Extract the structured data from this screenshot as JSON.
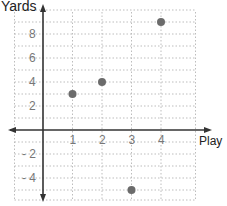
{
  "chart_data": {
    "type": "scatter",
    "title": "",
    "xlabel": "Play",
    "ylabel": "Yards",
    "x": [
      1,
      2,
      3,
      4
    ],
    "y": [
      3,
      4,
      -5,
      9
    ],
    "points": [
      {
        "x": 1,
        "y": 3
      },
      {
        "x": 2,
        "y": 4
      },
      {
        "x": 3,
        "y": -5
      },
      {
        "x": 4,
        "y": 9
      }
    ],
    "x_ticks": [
      "1",
      "2",
      "3",
      "4"
    ],
    "y_ticks": [
      "8",
      "6",
      "4",
      "2",
      "-2",
      "-4"
    ],
    "xlim": [
      -1,
      5
    ],
    "ylim": [
      -6,
      10
    ],
    "grid": true,
    "grid_style": "dotted",
    "legend": null,
    "colors": {
      "point": "#6b6b6b",
      "axis": "#333333",
      "grid": "#bdbdbd",
      "tick_label": "#777777"
    }
  },
  "labels": {
    "y_axis": "Yards",
    "x_axis": "Play"
  }
}
